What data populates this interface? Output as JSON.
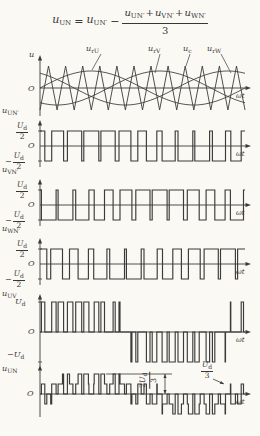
{
  "figure": {
    "width": 260,
    "height": 436,
    "bg": "#fbf9f4",
    "ink": "#3b3b3b"
  },
  "formula": {
    "lhs": {
      "base": "u",
      "sub": "UN"
    },
    "eq": "=",
    "t1": {
      "base": "u",
      "sub": "UN′"
    },
    "minus": "−",
    "frac": {
      "n1": {
        "base": "u",
        "sub": "UN′"
      },
      "p1": "+",
      "n2": {
        "base": "u",
        "sub": "VN′"
      },
      "p2": "+",
      "n3": {
        "base": "u",
        "sub": "WN′"
      },
      "den": "3"
    }
  },
  "carrier_labels": [
    {
      "base": "u",
      "sub": "rU"
    },
    {
      "base": "u",
      "sub": "rV"
    },
    {
      "base": "u",
      "sub": "c"
    },
    {
      "base": "u",
      "sub": "rW"
    }
  ],
  "panels": [
    {
      "ylabel": {
        "base": "u",
        "sub": ""
      },
      "origin": "O",
      "xlabel": "ωt"
    },
    {
      "ylabel": {
        "base": "u",
        "sub": "UN′"
      },
      "pos": {
        "nb": "U",
        "ns": "d",
        "den": "2"
      },
      "minus": "−",
      "neg": {
        "nb": "U",
        "ns": "d",
        "den": "2"
      },
      "origin": "O",
      "xlabel": "ωt"
    },
    {
      "ylabel": {
        "base": "u",
        "sub": "VN′"
      },
      "pos": {
        "nb": "U",
        "ns": "d",
        "den": "2"
      },
      "minus": "−",
      "neg": {
        "nb": "U",
        "ns": "d",
        "den": "2"
      },
      "origin": "O",
      "xlabel": "ωt"
    },
    {
      "ylabel": {
        "base": "u",
        "sub": "WN′"
      },
      "pos": {
        "nb": "U",
        "ns": "d",
        "den": "2"
      },
      "minus": "−",
      "neg": {
        "nb": "U",
        "ns": "d",
        "den": "2"
      },
      "origin": "O",
      "xlabel": "ωt"
    },
    {
      "ylabel": {
        "base": "u",
        "sub": "UV"
      },
      "pos_plain": {
        "base": "U",
        "sub": "d"
      },
      "minus": "−",
      "neg_plain": {
        "base": "U",
        "sub": "d"
      },
      "origin": "O",
      "xlabel": "ωt"
    },
    {
      "ylabel": {
        "base": "u",
        "sub": "UN"
      },
      "origin": "O",
      "xlabel": "ωt",
      "ann_2ud3": {
        "num_pre": "2",
        "nb": "U",
        "ns": "d",
        "den": "3"
      },
      "ann_ud3": {
        "nb": "U",
        "ns": "d",
        "den": "3"
      }
    }
  ],
  "chart_data": {
    "type": "line",
    "x_axis": "ωt",
    "params": {
      "carrier_cycles": 12,
      "modulation_index": 0.78,
      "ref_phases": [
        0,
        0.33333,
        0.66667
      ]
    },
    "panels": [
      {
        "name": "carrier and references",
        "signals": [
          "u_c (triangular carrier)",
          "u_rU",
          "u_rV",
          "u_rW"
        ],
        "note": "sinusoidal references shifted 120° apart, compared with common triangular carrier"
      },
      {
        "name": "u_UN′",
        "levels": [
          "+Ud/2",
          "−Ud/2"
        ],
        "rule": "+Ud/2 when u_rU > u_c, else −Ud/2"
      },
      {
        "name": "u_VN′",
        "levels": [
          "+Ud/2",
          "−Ud/2"
        ],
        "rule": "+Ud/2 when u_rV > u_c, else −Ud/2"
      },
      {
        "name": "u_WN′",
        "levels": [
          "+Ud/2",
          "−Ud/2"
        ],
        "rule": "+Ud/2 when u_rW > u_c, else −Ud/2"
      },
      {
        "name": "u_UV",
        "levels": [
          "+Ud",
          "0",
          "−Ud"
        ],
        "rule": "u_UN′ − u_VN′"
      },
      {
        "name": "u_UN",
        "levels": [
          "+2Ud/3",
          "+Ud/3",
          "0",
          "−Ud/3",
          "−2Ud/3"
        ],
        "rule": "u_UN′ − (u_UN′ + u_VN′ + u_WN′)/3",
        "annotations": [
          "2Ud/3",
          "Ud/3"
        ]
      }
    ]
  },
  "layout": {
    "x0": 40,
    "xw": 245,
    "xa": 251,
    "panels": [
      {
        "axisY": 88,
        "yTop": 55,
        "yBot": 116,
        "triAmp": 22,
        "sinAmp": 17
      },
      {
        "axisY": 146,
        "yTop": 120,
        "yBot": 167,
        "unit": 30
      },
      {
        "axisY": 205,
        "yTop": 179,
        "yBot": 226,
        "unit": 30
      },
      {
        "axisY": 264,
        "yTop": 238,
        "yBot": 285,
        "unit": 30
      },
      {
        "axisY": 332,
        "yTop": 294,
        "yBot": 366,
        "unit": 30
      },
      {
        "axisY": 394,
        "yTop": 365,
        "yBot": 417,
        "unit": 30
      }
    ],
    "leaders": [
      [
        101,
        54,
        92,
        70
      ],
      [
        160,
        54,
        155,
        73
      ],
      [
        190,
        54,
        186,
        66
      ],
      [
        221,
        54,
        231,
        73
      ]
    ],
    "ann": {
      "hline": [
        106,
        374,
        172,
        374
      ],
      "varrow": [
        165,
        374,
        165,
        394
      ],
      "leader": [
        213,
        379,
        224,
        384
      ]
    }
  }
}
